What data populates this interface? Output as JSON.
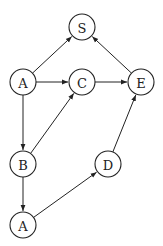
{
  "diagram": {
    "type": "directed-graph",
    "node_radius": 13,
    "colors": {
      "stroke": "#222222",
      "fill": "#ffffff",
      "text": "#222222"
    },
    "nodes": [
      {
        "id": "S",
        "label": "S",
        "x": 82,
        "y": 27
      },
      {
        "id": "A1",
        "label": "A",
        "x": 23,
        "y": 82
      },
      {
        "id": "C",
        "label": "C",
        "x": 82,
        "y": 82
      },
      {
        "id": "E",
        "label": "E",
        "x": 141,
        "y": 82
      },
      {
        "id": "B",
        "label": "B",
        "x": 23,
        "y": 164
      },
      {
        "id": "D",
        "label": "D",
        "x": 108,
        "y": 164
      },
      {
        "id": "A2",
        "label": "A",
        "x": 23,
        "y": 225
      }
    ],
    "edges": [
      {
        "from": "A1",
        "to": "S"
      },
      {
        "from": "A1",
        "to": "C"
      },
      {
        "from": "A1",
        "to": "B"
      },
      {
        "from": "C",
        "to": "E"
      },
      {
        "from": "E",
        "to": "S"
      },
      {
        "from": "B",
        "to": "C"
      },
      {
        "from": "B",
        "to": "A2"
      },
      {
        "from": "A2",
        "to": "D"
      },
      {
        "from": "D",
        "to": "E"
      }
    ]
  }
}
